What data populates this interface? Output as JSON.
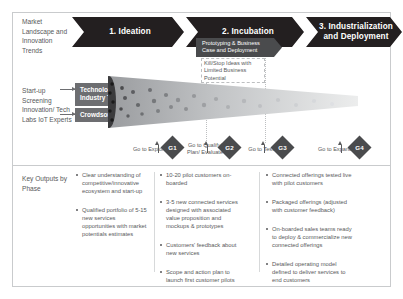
{
  "left_labels": {
    "market": "Market Landscape and Innovation Trends",
    "startup": "Start-up Screening Innovation/ Tech Labs IoT Experts",
    "key_outputs": "Key Outputs by Phase"
  },
  "phases": [
    {
      "id": "phase-1",
      "label": "1. Ideation"
    },
    {
      "id": "phase-2",
      "label": "2. Incubation"
    },
    {
      "id": "phase-3",
      "label": "3. Industrialization and Deployment"
    }
  ],
  "inputs": [
    {
      "id": "technology-industry-trends",
      "label": "Technology/ Industry Trends"
    },
    {
      "id": "crowdsourcing",
      "label": "Crowdsourcing"
    }
  ],
  "callouts": {
    "prototyping": "Prototyping & Business Case and Deployment",
    "kill_stop": "Kill/Stop Ideas with Limited Business Potential"
  },
  "gates": [
    {
      "id": "g1",
      "code": "G1",
      "label": "Go to Explore"
    },
    {
      "id": "g2",
      "code": "G2",
      "label": "Go to Qualify/ Plan/ Evaluate"
    },
    {
      "id": "g3",
      "code": "G3",
      "label": "Go to Test"
    },
    {
      "id": "g4",
      "code": "G4",
      "label": "Go to Expand"
    }
  ],
  "outputs": {
    "column_1": [
      "Clear understanding of competitive/innovative ecosystem and start-up",
      "Qualified portfolio of 5-15 new services opportunities with market potentials estimates"
    ],
    "column_2": [
      "10-20 pilot customers on-boarded",
      "3-5 new connected services designed with associated value proposition and mockups & prototypes",
      "Customers' feedback about new services",
      "Scope and action plan to launch first customer pilots"
    ],
    "column_3": [
      "Connected offerings tested live with pilot customers",
      "Packaged offerings (adjusted with customer feedback)",
      "On-boarded sales teams ready to deploy & commercialize new connected offerings",
      "Detailed operating model defined to deliver services to end customers"
    ]
  },
  "colors": {
    "dark": "#231f20",
    "mid_gray": "#6d6e71",
    "gate": "#4a4b4d",
    "text": "#58595b",
    "border": "#c9cbcd"
  }
}
